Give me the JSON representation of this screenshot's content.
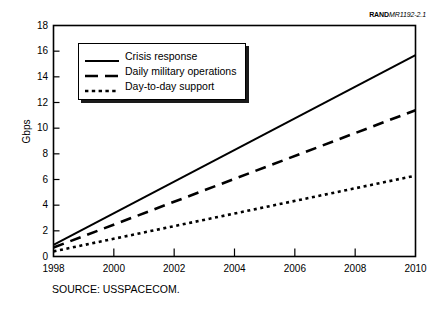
{
  "figure": {
    "rand_label": "RAND",
    "rand_number": "MR1192-2.1",
    "source_caption": "SOURCE:  USSPACECOM."
  },
  "chart_data": {
    "type": "line",
    "title": "",
    "xlabel": "",
    "ylabel": "Gbps",
    "xlim": [
      1998,
      2010
    ],
    "ylim": [
      0,
      18
    ],
    "ytick_step": 2,
    "xtick_step": 2,
    "xminor_step": 1,
    "grid": false,
    "legend_position": "upper-left-inside",
    "xticks": [
      1998,
      2000,
      2002,
      2004,
      2006,
      2008,
      2010
    ],
    "xtick_labels": [
      "1998",
      "2000",
      "2002",
      "2004",
      "2006",
      "2008",
      "2010"
    ],
    "yticks": [
      0,
      2,
      4,
      6,
      8,
      10,
      12,
      14,
      16,
      18
    ],
    "ytick_labels": [
      "0",
      "2",
      "4",
      "6",
      "8",
      "10",
      "12",
      "14",
      "16",
      "18"
    ],
    "x": [
      1998,
      2010
    ],
    "series": [
      {
        "name": "Crisis response",
        "style": "solid",
        "color": "#000000",
        "values": [
          0.9,
          15.7
        ]
      },
      {
        "name": "Daily military operations",
        "style": "dashed",
        "color": "#000000",
        "values": [
          0.7,
          11.4
        ]
      },
      {
        "name": "Day-to-day support",
        "style": "dotted",
        "color": "#000000",
        "values": [
          0.4,
          6.3
        ]
      }
    ]
  }
}
